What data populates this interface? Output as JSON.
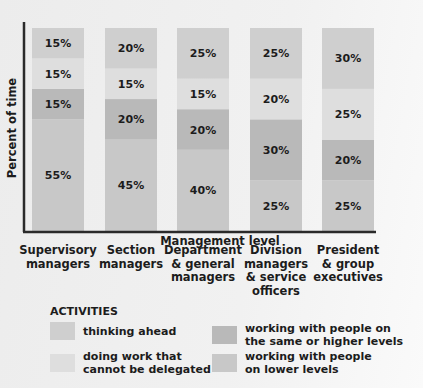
{
  "chart_data": {
    "type": "bar",
    "stacked": true,
    "title": "",
    "xlabel": "Management level",
    "ylabel": "Percent of time",
    "ylim": [
      0,
      100
    ],
    "grid": false,
    "categories": [
      "Supervisory\nmanagers",
      "Section\nmanagers",
      "Department\n& general\nmanagers",
      "Division\nmanagers\n& service\nofficers",
      "President\n& group\nexecutives"
    ],
    "series": [
      {
        "name": "working with people on lower levels",
        "color": "#c8c8c8",
        "values": [
          55,
          45,
          40,
          25,
          25
        ]
      },
      {
        "name": "working with people on the same or higher levels",
        "color": "#b9b9b9",
        "values": [
          15,
          20,
          20,
          30,
          20
        ]
      },
      {
        "name": "doing work that cannot be delegated",
        "color": "#dedede",
        "values": [
          15,
          15,
          15,
          20,
          25
        ]
      },
      {
        "name": "thinking ahead",
        "color": "#cfcfcf",
        "values": [
          15,
          20,
          25,
          25,
          30
        ]
      }
    ],
    "value_suffix": "%",
    "legend": {
      "title": "ACTIVITIES",
      "placement": "bottom",
      "items": [
        {
          "label": "thinking ahead",
          "color": "#cfcfcf"
        },
        {
          "label": "doing work that\ncannot be delegated",
          "color": "#dedede"
        },
        {
          "label": "working with people on\nthe same or higher levels",
          "color": "#b9b9b9"
        },
        {
          "label": "working with people\non lower levels",
          "color": "#c8c8c8"
        }
      ]
    }
  },
  "axis_color": "#2a2a2a"
}
